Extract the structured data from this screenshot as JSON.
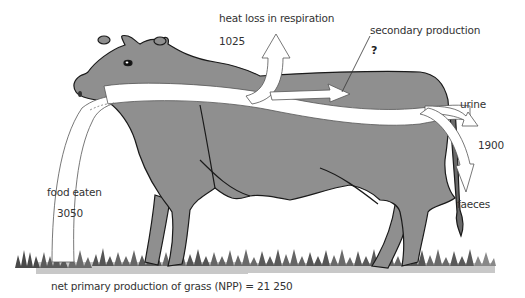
{
  "diagram": {
    "labels": {
      "heat_loss": "heat loss in respiration",
      "heat_loss_value": "1025",
      "secondary_production": "secondary production",
      "secondary_production_value": "?",
      "urine": "urine",
      "urine_faeces_value": "1900",
      "faeces": "faeces",
      "food_eaten": "food eaten",
      "food_eaten_value": "3050",
      "npp": "net primary production of grass (NPP) = 21 250"
    },
    "colors": {
      "cow_body": "#8f8f8f",
      "outline": "#1a1a1a",
      "arrow_fill": "#ffffff",
      "grass_dark": "#4a4a4a",
      "grass_light": "#c8c8c8",
      "text": "#333333"
    }
  }
}
